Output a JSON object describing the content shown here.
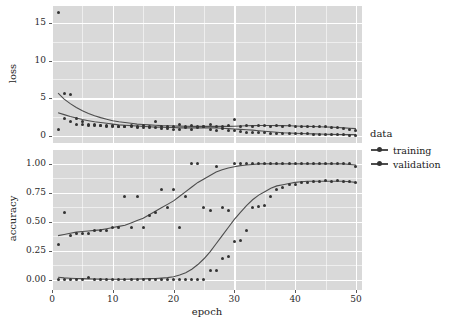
{
  "chart_data": {
    "type": "scatter",
    "title": "",
    "xlabel": "epoch",
    "legend_title": "data",
    "legend_position": "right",
    "grid": true,
    "panel_background": "#d9d9d9",
    "gridline_color": "#ffffff",
    "point_color": "#333333",
    "line_color": "#4d4d4d",
    "x": [
      1,
      2,
      3,
      4,
      5,
      6,
      7,
      8,
      9,
      10,
      11,
      12,
      13,
      14,
      15,
      16,
      17,
      18,
      19,
      20,
      21,
      22,
      23,
      24,
      25,
      26,
      27,
      28,
      29,
      30,
      31,
      32,
      33,
      34,
      35,
      36,
      37,
      38,
      39,
      40,
      41,
      42,
      43,
      44,
      45,
      46,
      47,
      48,
      49,
      50
    ],
    "xlim": [
      0,
      51
    ],
    "xticks": [
      0,
      10,
      20,
      30,
      40,
      50
    ],
    "xticklabels": [
      "0",
      "10",
      "20",
      "30",
      "40",
      "50"
    ],
    "panels": [
      {
        "name": "loss",
        "ylabel": "loss",
        "ylim": [
          -0.9,
          17.2
        ],
        "yticks": [
          0,
          5,
          10,
          15
        ],
        "yticklabels": [
          "0",
          "5",
          "10",
          "15"
        ],
        "series": [
          {
            "name": "training",
            "values": [
              16.4,
              5.6,
              5.5,
              2.4,
              1.9,
              1.6,
              1.5,
              1.45,
              1.4,
              1.35,
              1.3,
              1.3,
              1.25,
              1.2,
              1.35,
              1.2,
              1.1,
              1.0,
              1.0,
              0.95,
              0.9,
              1.2,
              0.95,
              1.2,
              1.3,
              0.85,
              0.8,
              1.05,
              0.75,
              0.7,
              0.6,
              0.55,
              0.5,
              0.5,
              0.45,
              0.4,
              0.4,
              0.35,
              0.35,
              0.3,
              0.3,
              0.3,
              0.25,
              0.25,
              0.2,
              0.2,
              0.2,
              0.2,
              0.15,
              0.15
            ],
            "smooth": [
              3.1,
              2.85,
              2.6,
              2.4,
              2.2,
              2.05,
              1.9,
              1.8,
              1.7,
              1.6,
              1.5,
              1.45,
              1.4,
              1.35,
              1.3,
              1.25,
              1.2,
              1.2,
              1.15,
              1.15,
              1.1,
              1.1,
              1.1,
              1.1,
              1.1,
              1.1,
              1.1,
              1.05,
              1.0,
              0.95,
              0.9,
              0.85,
              0.8,
              0.72,
              0.65,
              0.58,
              0.52,
              0.46,
              0.42,
              0.38,
              0.35,
              0.32,
              0.3,
              0.28,
              0.26,
              0.24,
              0.22,
              0.21,
              0.2,
              0.2
            ]
          },
          {
            "name": "validation",
            "values": [
              0.9,
              2.4,
              1.95,
              1.6,
              1.5,
              1.45,
              1.4,
              1.35,
              1.3,
              1.3,
              1.3,
              1.3,
              1.45,
              1.3,
              1.2,
              1.25,
              2.0,
              1.3,
              1.3,
              1.25,
              1.5,
              1.3,
              1.4,
              1.25,
              1.3,
              1.55,
              1.3,
              1.3,
              1.35,
              2.25,
              1.3,
              1.35,
              1.3,
              1.35,
              1.35,
              1.3,
              1.35,
              1.3,
              1.35,
              1.3,
              1.3,
              1.3,
              1.3,
              1.25,
              1.25,
              1.2,
              1.15,
              1.0,
              0.85,
              0.7
            ],
            "smooth": [
              5.7,
              4.9,
              4.3,
              3.8,
              3.35,
              3.0,
              2.7,
              2.45,
              2.25,
              2.05,
              1.9,
              1.8,
              1.7,
              1.6,
              1.55,
              1.5,
              1.45,
              1.4,
              1.38,
              1.35,
              1.33,
              1.32,
              1.3,
              1.3,
              1.3,
              1.3,
              1.3,
              1.3,
              1.3,
              1.32,
              1.35,
              1.38,
              1.4,
              1.42,
              1.42,
              1.42,
              1.4,
              1.4,
              1.38,
              1.35,
              1.32,
              1.3,
              1.28,
              1.25,
              1.22,
              1.2,
              1.15,
              1.1,
              1.05,
              1.0
            ]
          }
        ]
      },
      {
        "name": "accuracy",
        "ylabel": "accuracy",
        "ylim": [
          -0.09,
          1.12
        ],
        "yticks": [
          0.0,
          0.25,
          0.5,
          0.75,
          1.0
        ],
        "yticklabels": [
          "0.00",
          "0.25",
          "0.50",
          "0.75",
          "1.00"
        ],
        "series": [
          {
            "name": "training",
            "values": [
              0.0,
              0.0,
              0.0,
              0.0,
              0.0,
              0.02,
              0.0,
              0.0,
              0.0,
              0.0,
              0.0,
              0.0,
              0.0,
              0.0,
              0.0,
              0.0,
              0.0,
              0.0,
              0.0,
              0.0,
              0.0,
              0.0,
              0.0,
              0.0,
              0.0,
              0.08,
              0.08,
              0.18,
              0.2,
              0.33,
              0.34,
              0.42,
              0.62,
              0.63,
              0.64,
              0.72,
              0.78,
              0.8,
              0.82,
              0.82,
              0.84,
              0.84,
              0.85,
              0.85,
              0.86,
              0.85,
              0.86,
              0.85,
              0.85,
              0.84
            ],
            "smooth": [
              0.02,
              0.015,
              0.012,
              0.01,
              0.008,
              0.006,
              0.005,
              0.004,
              0.003,
              0.003,
              0.003,
              0.003,
              0.004,
              0.005,
              0.006,
              0.008,
              0.01,
              0.013,
              0.017,
              0.025,
              0.04,
              0.06,
              0.09,
              0.13,
              0.18,
              0.24,
              0.31,
              0.38,
              0.45,
              0.52,
              0.58,
              0.64,
              0.69,
              0.73,
              0.76,
              0.79,
              0.81,
              0.82,
              0.83,
              0.84,
              0.845,
              0.85,
              0.85,
              0.85,
              0.85,
              0.85,
              0.85,
              0.85,
              0.845,
              0.84
            ]
          },
          {
            "name": "validation",
            "values": [
              0.3,
              0.58,
              0.38,
              0.4,
              0.4,
              0.4,
              0.42,
              0.42,
              0.42,
              0.45,
              0.45,
              0.72,
              0.45,
              0.72,
              0.45,
              0.55,
              0.58,
              0.78,
              0.62,
              0.78,
              0.45,
              0.72,
              1.0,
              1.0,
              0.62,
              0.6,
              0.98,
              0.62,
              0.6,
              1.0,
              1.0,
              1.0,
              1.0,
              1.0,
              1.0,
              1.0,
              1.0,
              1.0,
              1.0,
              1.0,
              1.0,
              1.0,
              1.0,
              1.0,
              1.0,
              1.0,
              1.0,
              1.0,
              1.0,
              0.98
            ],
            "smooth": [
              0.38,
              0.39,
              0.4,
              0.41,
              0.415,
              0.42,
              0.425,
              0.43,
              0.44,
              0.45,
              0.46,
              0.47,
              0.49,
              0.51,
              0.53,
              0.56,
              0.59,
              0.62,
              0.65,
              0.68,
              0.72,
              0.76,
              0.8,
              0.84,
              0.87,
              0.9,
              0.93,
              0.95,
              0.965,
              0.975,
              0.985,
              0.99,
              0.995,
              1.0,
              1.0,
              1.0,
              1.0,
              1.0,
              1.0,
              1.0,
              1.0,
              1.0,
              1.0,
              1.0,
              1.0,
              1.0,
              1.0,
              1.0,
              0.995,
              0.99
            ]
          }
        ]
      }
    ]
  }
}
